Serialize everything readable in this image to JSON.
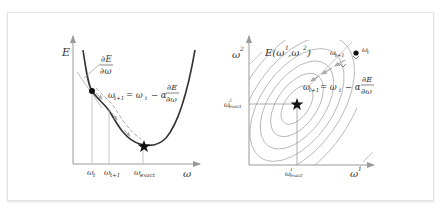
{
  "left_panel": {
    "y_axis_label": "E",
    "x_axis_label": "ω",
    "gradient_label_num": "∂E",
    "gradient_label_den": "∂ω",
    "update_rule_lhs": "ω",
    "update_rule_lhs_sub": "t+1",
    "update_rule_mid": "= ω",
    "update_rule_mid_sub": "t",
    "update_rule_rhs": "− α",
    "update_rule_frac_num": "∂E",
    "update_rule_frac_den": "∂ω",
    "tick_wt": "ω",
    "tick_wt_sub": "t",
    "tick_wt1": "ω",
    "tick_wt1_sub": "t+1",
    "tick_wexact": "ω",
    "tick_wexact_sub": "exact"
  },
  "right_panel": {
    "y_axis_label": "ω",
    "y_axis_sup": "2",
    "x_axis_label": "ω",
    "x_axis_sup": "1",
    "function_label": "E(ω",
    "function_sup1": "1",
    "function_mid": ",ω",
    "function_sup2": "2",
    "function_close": ")",
    "point_wt": "ω",
    "point_wt_sub": "t",
    "point_wt1": "ω",
    "point_wt1_sub": "t+1",
    "update_rule_lhs": "ω",
    "update_rule_lhs_sub": "t+1",
    "update_rule_mid": "= ω",
    "update_rule_mid_sub": "t",
    "update_rule_rhs": "− α",
    "update_rule_frac_num": "∂E",
    "update_rule_frac_den": "∂ω",
    "exact_y_label": "ω",
    "exact_y_sup": "2",
    "exact_y_sub": "exact",
    "exact_x_label": "ω",
    "exact_x_sup": "1",
    "exact_x_sub": "exact"
  },
  "colors": {
    "curve": "#333333",
    "axis": "#999999",
    "contour": "#b0b0b0",
    "arrow": "#aaaaaa",
    "guide": "#bbbbbb"
  }
}
